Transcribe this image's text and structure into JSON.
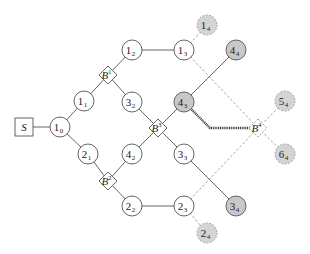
{
  "diagram": {
    "type": "tree-network",
    "source": {
      "id": "S",
      "label": "S",
      "x": 24,
      "y": 127
    },
    "nodes": [
      {
        "id": "1_0",
        "main": "1",
        "sub": "0",
        "x": 60,
        "y": 127,
        "style": "plain"
      },
      {
        "id": "1_1",
        "main": "1",
        "sub": "1",
        "x": 84,
        "y": 101,
        "style": "plain"
      },
      {
        "id": "2_1",
        "main": "2",
        "sub": "1",
        "x": 88,
        "y": 154,
        "style": "plain"
      },
      {
        "id": "1_2",
        "main": "1",
        "sub": "2",
        "x": 132,
        "y": 50,
        "style": "plain"
      },
      {
        "id": "3_2",
        "main": "3",
        "sub": "2",
        "x": 132,
        "y": 102,
        "style": "plain"
      },
      {
        "id": "4_2",
        "main": "4",
        "sub": "2",
        "x": 132,
        "y": 154,
        "style": "plain"
      },
      {
        "id": "2_2",
        "main": "2",
        "sub": "2",
        "x": 132,
        "y": 206,
        "style": "plain"
      },
      {
        "id": "1_3",
        "main": "1",
        "sub": "3",
        "x": 184,
        "y": 50,
        "style": "plain"
      },
      {
        "id": "4_3",
        "main": "4",
        "sub": "3",
        "x": 184,
        "y": 102,
        "style": "filled"
      },
      {
        "id": "3_3",
        "main": "3",
        "sub": "3",
        "x": 184,
        "y": 154,
        "style": "plain"
      },
      {
        "id": "2_3",
        "main": "2",
        "sub": "3",
        "x": 184,
        "y": 206,
        "style": "plain"
      },
      {
        "id": "1_4",
        "main": "1",
        "sub": "4",
        "x": 207,
        "y": 25,
        "style": "dashed-filled"
      },
      {
        "id": "4_4",
        "main": "4",
        "sub": "4",
        "x": 236,
        "y": 50,
        "style": "filled"
      },
      {
        "id": "5_4",
        "main": "5",
        "sub": "4",
        "x": 285,
        "y": 101,
        "style": "dashed-filled"
      },
      {
        "id": "6_4",
        "main": "6",
        "sub": "4",
        "x": 285,
        "y": 154,
        "style": "dashed-filled"
      },
      {
        "id": "3_4",
        "main": "3",
        "sub": "4",
        "x": 236,
        "y": 206,
        "style": "filled"
      },
      {
        "id": "2_4",
        "main": "2",
        "sub": "4",
        "x": 207,
        "y": 233,
        "style": "dashed-filled"
      }
    ],
    "branch_points": [
      {
        "id": "B1",
        "main": "B",
        "sup": "1",
        "x": 108,
        "y": 75,
        "style": "solid"
      },
      {
        "id": "B2",
        "main": "B",
        "sup": "2",
        "x": 108,
        "y": 181,
        "style": "solid"
      },
      {
        "id": "B3",
        "main": "B",
        "sup": "3",
        "x": 158,
        "y": 128,
        "style": "solid"
      },
      {
        "id": "B4",
        "main": "B",
        "sup": "4",
        "x": 258,
        "y": 128,
        "style": "dashed"
      }
    ],
    "edges": [
      {
        "from": "S",
        "to": "1_0",
        "style": "solid"
      },
      {
        "from": "1_0",
        "to": "1_1",
        "style": "solid"
      },
      {
        "from": "1_0",
        "to": "2_1",
        "style": "solid"
      },
      {
        "from": "1_1",
        "to": "B1",
        "style": "solid"
      },
      {
        "from": "B1",
        "to": "1_2",
        "style": "solid"
      },
      {
        "from": "B1",
        "to": "3_2",
        "style": "solid"
      },
      {
        "from": "2_1",
        "to": "B2",
        "style": "solid"
      },
      {
        "from": "B2",
        "to": "4_2",
        "style": "solid"
      },
      {
        "from": "B2",
        "to": "2_2",
        "style": "solid"
      },
      {
        "from": "3_2",
        "to": "B3",
        "style": "solid"
      },
      {
        "from": "4_2",
        "to": "B3",
        "style": "solid"
      },
      {
        "from": "B3",
        "to": "4_3",
        "style": "solid"
      },
      {
        "from": "B3",
        "to": "3_3",
        "style": "solid"
      },
      {
        "from": "1_2",
        "to": "1_3",
        "style": "solid"
      },
      {
        "from": "2_2",
        "to": "2_3",
        "style": "solid"
      },
      {
        "from": "4_3",
        "to": "4_4",
        "style": "solid"
      },
      {
        "from": "3_3",
        "to": "3_4",
        "style": "solid"
      },
      {
        "from": "1_3",
        "to": "1_4",
        "style": "dashed"
      },
      {
        "from": "2_3",
        "to": "2_4",
        "style": "dashed"
      },
      {
        "from": "1_3",
        "to": "B4",
        "style": "dashed"
      },
      {
        "from": "2_3",
        "to": "B4",
        "style": "dashed"
      },
      {
        "from": "B4",
        "to": "5_4",
        "style": "dashed"
      },
      {
        "from": "B4",
        "to": "6_4",
        "style": "dashed"
      },
      {
        "from": "4_3",
        "to": "B4",
        "style": "thick-dotted",
        "via": {
          "x": 210,
          "y": 128
        }
      }
    ],
    "colors": {
      "stroke": "#555555",
      "plain_fill": "#ffffff",
      "filled_fill": "#c8c8c8",
      "dashed_fill": "#d4d4d4",
      "dashed_stroke": "#999999",
      "thick_dotted": "#333333"
    }
  }
}
